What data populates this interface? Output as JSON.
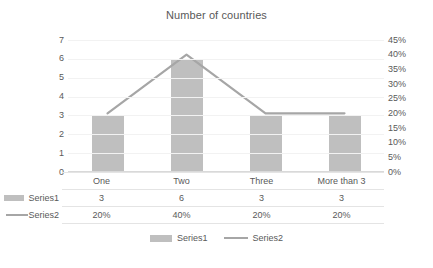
{
  "chart_data": {
    "type": "bar",
    "title": "Number of countries",
    "xlabel": "",
    "ylabel": "",
    "categories": [
      "One",
      "Two",
      "Three",
      "More than 3"
    ],
    "series": [
      {
        "name": "Series1",
        "type": "bar",
        "axis": "left",
        "values": [
          3,
          6,
          3,
          3
        ],
        "display_values": [
          "3",
          "6",
          "3",
          "3"
        ],
        "color": "#bfbfbf"
      },
      {
        "name": "Series2",
        "type": "line",
        "axis": "right",
        "values": [
          20,
          40,
          20,
          20
        ],
        "display_values": [
          "20%",
          "40%",
          "20%",
          "20%"
        ],
        "color": "#a6a6a6"
      }
    ],
    "left_axis": {
      "ticks": [
        "0",
        "1",
        "2",
        "3",
        "4",
        "5",
        "6",
        "7"
      ],
      "min": 0,
      "max": 7
    },
    "right_axis": {
      "ticks": [
        "0%",
        "5%",
        "10%",
        "15%",
        "20%",
        "25%",
        "30%",
        "35%",
        "40%",
        "45%"
      ],
      "min": 0,
      "max": 45
    },
    "grid": true,
    "legend_position": "bottom",
    "data_table": true
  },
  "legend": {
    "items": [
      {
        "label": "Series1",
        "marker": "legend-swatch-icon"
      },
      {
        "label": "Series2",
        "marker": "legend-line-icon"
      }
    ]
  },
  "table": {
    "row_keys": [
      "Series1",
      "Series2"
    ],
    "header": [
      "One",
      "Two",
      "Three",
      "More than 3"
    ],
    "rows": [
      [
        "3",
        "6",
        "3",
        "3"
      ],
      [
        "20%",
        "40%",
        "20%",
        "20%"
      ]
    ]
  }
}
